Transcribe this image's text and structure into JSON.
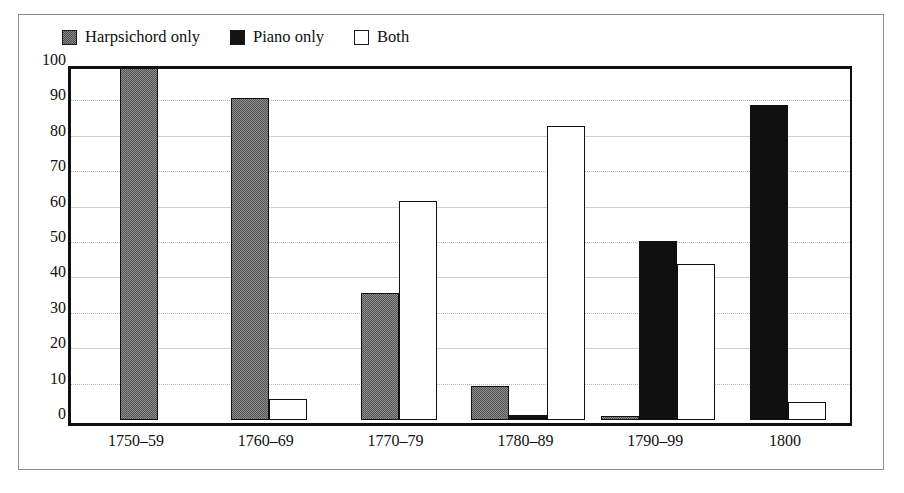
{
  "chart_data": {
    "type": "bar",
    "title": "",
    "subtitle": "",
    "xlabel": "",
    "ylabel": "",
    "categories": [
      "1750–59",
      "1760–69",
      "1770–79",
      "1780–89",
      "1790–99",
      "1800"
    ],
    "series": [
      {
        "name": "Harpsichord only",
        "color": "#8d8d8d",
        "pattern": "checker-gray",
        "values": [
          100,
          91,
          36,
          9.5,
          1.2,
          0
        ]
      },
      {
        "name": "Piano only",
        "color": "#101010",
        "pattern": "solid-black",
        "values": [
          0,
          0,
          0,
          1.5,
          50.5,
          89
        ]
      },
      {
        "name": "Both",
        "color": "#ffffff",
        "pattern": "white-outline",
        "values": [
          0,
          6,
          62,
          83,
          44,
          5
        ]
      }
    ],
    "ylim": [
      0,
      100
    ],
    "yticks": [
      0,
      10,
      20,
      30,
      40,
      50,
      60,
      70,
      80,
      90,
      100
    ],
    "ytick_labels": [
      "0",
      "10",
      "20",
      "30",
      "40",
      "50",
      "60",
      "70",
      "80",
      "90",
      "100"
    ],
    "grid": true,
    "grid_style": "dotted horizontal gridlines",
    "legend_position": "top-left above plot",
    "legend_entries": [
      "Harpsichord only",
      "Piano only",
      "Both"
    ]
  },
  "legend": {
    "items": [
      {
        "label": "Harpsichord only",
        "swatch": "harpsichord-swatch-icon"
      },
      {
        "label": "Piano only",
        "swatch": "piano-swatch-icon"
      },
      {
        "label": "Both",
        "swatch": "both-swatch-icon"
      }
    ]
  }
}
